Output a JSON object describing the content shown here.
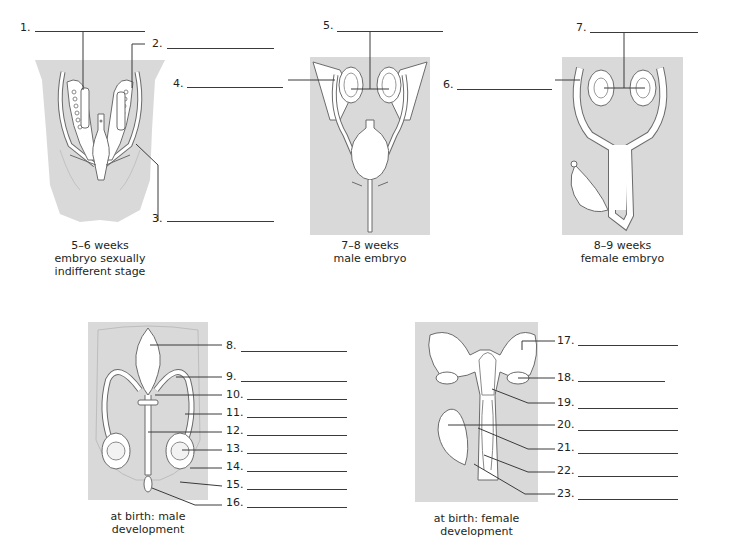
{
  "colors": {
    "panel_bg": "#d9d9d9",
    "organ_fill": "#ffffff",
    "outline": "#6b6b6b",
    "leader_line": "#3a3a3a",
    "text": "#231f20"
  },
  "panels": [
    {
      "id": "p1",
      "caption_lines": [
        "5–6 weeks",
        "embryo sexually",
        "indifferent stage"
      ]
    },
    {
      "id": "p2",
      "caption_lines": [
        "7–8 weeks",
        "male embryo"
      ]
    },
    {
      "id": "p3",
      "caption_lines": [
        "8–9 weeks",
        "female embryo"
      ]
    },
    {
      "id": "p4",
      "caption_lines": [
        "at birth: male",
        "development"
      ]
    },
    {
      "id": "p5",
      "caption_lines": [
        "at birth: female",
        "development"
      ]
    }
  ],
  "labels": [
    {
      "n": "1.",
      "answer": ""
    },
    {
      "n": "2.",
      "answer": ""
    },
    {
      "n": "3.",
      "answer": ""
    },
    {
      "n": "4.",
      "answer": ""
    },
    {
      "n": "5.",
      "answer": ""
    },
    {
      "n": "6.",
      "answer": ""
    },
    {
      "n": "7.",
      "answer": ""
    },
    {
      "n": "8.",
      "answer": ""
    },
    {
      "n": "9.",
      "answer": ""
    },
    {
      "n": "10.",
      "answer": ""
    },
    {
      "n": "11.",
      "answer": ""
    },
    {
      "n": "12.",
      "answer": ""
    },
    {
      "n": "13.",
      "answer": ""
    },
    {
      "n": "14.",
      "answer": ""
    },
    {
      "n": "15.",
      "answer": ""
    },
    {
      "n": "16.",
      "answer": ""
    },
    {
      "n": "17.",
      "answer": ""
    },
    {
      "n": "18.",
      "answer": ""
    },
    {
      "n": "19.",
      "answer": ""
    },
    {
      "n": "20.",
      "answer": ""
    },
    {
      "n": "21.",
      "answer": ""
    },
    {
      "n": "22.",
      "answer": ""
    },
    {
      "n": "23.",
      "answer": ""
    }
  ]
}
